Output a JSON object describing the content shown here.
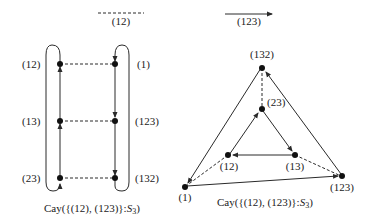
{
  "legend": {
    "dashed_label": "(12)",
    "solid_label": "(123)"
  },
  "left_graph": {
    "caption_prefix": "Cay({(12), (123)}:",
    "caption_group": "S",
    "caption_sub": "3",
    "caption_suffix": ")",
    "nodes": {
      "n12": "(12)",
      "n13": "(13)",
      "n23": "(23)",
      "n1": "(1)",
      "n123": "(123)",
      "n132": "(132)"
    }
  },
  "right_graph": {
    "caption_prefix": "Cay({(12), (123)}:",
    "caption_group": "S",
    "caption_sub": "3",
    "caption_suffix": ")",
    "nodes": {
      "n132": "(132)",
      "n23": "(23)",
      "n12": "(12)",
      "n13": "(13)",
      "n1": "(1)",
      "n123": "(123)"
    }
  },
  "colors": {
    "stroke": "#2a2a2a",
    "node": "#111111"
  }
}
